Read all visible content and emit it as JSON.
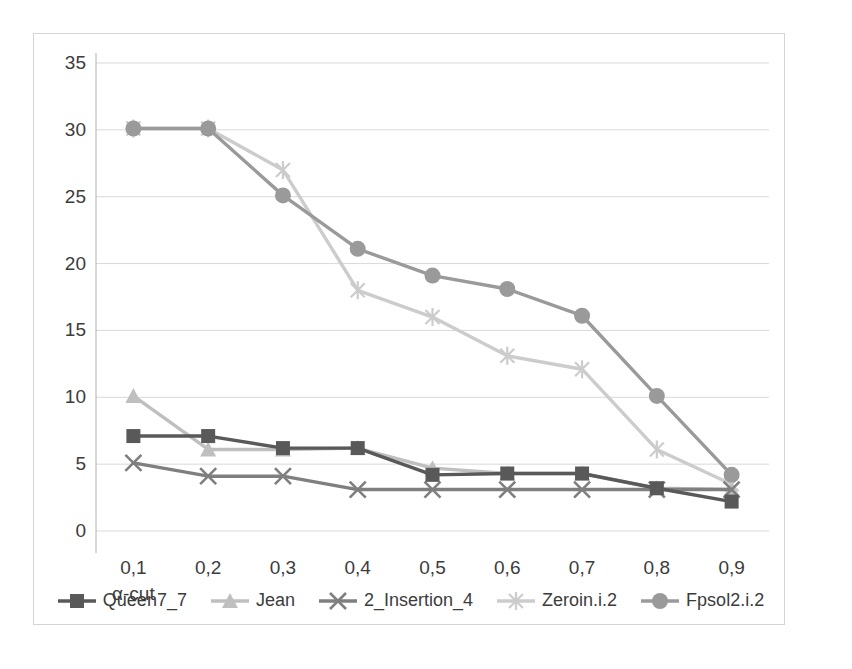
{
  "chart_data": {
    "type": "line",
    "title": "",
    "xlabel": "α-cut",
    "ylabel": "",
    "categories": [
      "0,1",
      "0,2",
      "0,3",
      "0,4",
      "0,5",
      "0,6",
      "0,7",
      "0,8",
      "0,9"
    ],
    "x_values": [
      0.1,
      0.2,
      0.3,
      0.4,
      0.5,
      0.6,
      0.7,
      0.8,
      0.9
    ],
    "ylim": [
      0,
      35
    ],
    "ytick_step": 5,
    "yticks": [
      "0",
      "5",
      "10",
      "15",
      "20",
      "25",
      "30",
      "35"
    ],
    "ytick_values": [
      0,
      5,
      10,
      15,
      20,
      25,
      30,
      35
    ],
    "grid": "horizontal",
    "legend_position": "bottom",
    "series": [
      {
        "name": "Queen7_7",
        "marker": "square",
        "color": "#595959",
        "values": [
          7.1,
          7.1,
          6.2,
          6.2,
          4.2,
          4.3,
          4.3,
          3.2,
          2.2
        ]
      },
      {
        "name": "Jean",
        "marker": "triangle",
        "color": "#bfbfbf",
        "values": [
          10.1,
          6.1,
          6.1,
          6.2,
          4.7,
          4.3,
          4.3,
          3.2,
          3.1
        ]
      },
      {
        "name": "2_Insertion_4",
        "marker": "x",
        "color": "#7f7f7f",
        "values": [
          5.1,
          4.1,
          4.1,
          3.1,
          3.1,
          3.1,
          3.1,
          3.1,
          3.1
        ]
      },
      {
        "name": "Zeroin.i.2",
        "marker": "asterisk",
        "color": "#cccccc",
        "values": [
          30.1,
          30.1,
          27.0,
          18.0,
          16.0,
          13.1,
          12.1,
          6.1,
          3.5
        ]
      },
      {
        "name": "Fpsol2.i.2",
        "marker": "circle",
        "color": "#9a9a9a",
        "values": [
          30.1,
          30.1,
          25.1,
          21.1,
          19.1,
          18.1,
          16.1,
          10.1,
          4.2
        ]
      }
    ]
  },
  "colors": {
    "grid": "#d9d9d9",
    "axis": "#b0b0b0",
    "text": "#3c3c3c",
    "frame": "#d4d4d4",
    "background": "#ffffff"
  }
}
